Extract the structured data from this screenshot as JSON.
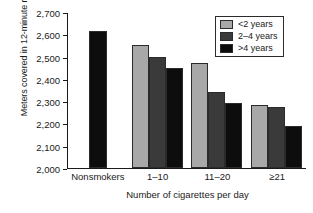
{
  "chart_data": {
    "type": "bar",
    "title": "",
    "xlabel": "Number of cigarettes per day",
    "ylabel": "Meters covered in 12-minute run",
    "categories": [
      "Nonsmokers",
      "1–10",
      "11–20",
      "≥21"
    ],
    "series": [
      {
        "name": "<2 years",
        "color": "#a8a8a8",
        "values": [
          null,
          2550,
          2470,
          2285
        ]
      },
      {
        "name": "2–4 years",
        "color": "#3a3a3a",
        "values": [
          null,
          2500,
          2340,
          2275
        ]
      },
      {
        "name": ">4 years",
        "color": "#0d0d0d",
        "values": [
          2615,
          2450,
          2290,
          2190
        ]
      }
    ],
    "nonsmokers_value": 2615,
    "ylim": [
      2000,
      2700
    ],
    "yticks": [
      2700,
      2600,
      2500,
      2400,
      2300,
      2200,
      2100,
      2000
    ],
    "ytick_labels": [
      "2,700",
      "2,600",
      "2,500",
      "2,400",
      "2,300",
      "2,200",
      "2,100",
      "2,000"
    ],
    "grid": false,
    "legend_position": "top-right"
  },
  "legend": {
    "entries": [
      {
        "label": "<2 years",
        "color": "#a8a8a8"
      },
      {
        "label": "2–4 years",
        "color": "#3a3a3a"
      },
      {
        "label": ">4 years",
        "color": "#0d0d0d"
      }
    ]
  }
}
